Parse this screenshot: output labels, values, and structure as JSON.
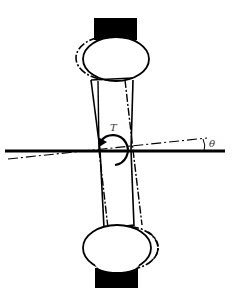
{
  "diagram": {
    "type": "torsion-specimen-schematic",
    "labels": {
      "torque": "T",
      "angle": "θ"
    },
    "colors": {
      "stroke": "#000000",
      "background": "#ffffff",
      "grip_fill": "#000000"
    },
    "elements": [
      "top-grip",
      "top-ball-joint",
      "specimen-body",
      "horizontal-reference-axis",
      "rotated-axis",
      "torque-arrow",
      "bottom-ball-joint",
      "bottom-grip"
    ]
  }
}
